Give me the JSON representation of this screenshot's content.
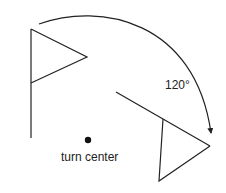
{
  "diagram": {
    "angle_label": "120°",
    "center_label": "turn center",
    "colors": {
      "stroke": "#222222",
      "background": "#ffffff"
    },
    "original_flag": {
      "pole": [
        [
          31,
          29
        ],
        [
          31,
          138
        ]
      ],
      "triangle": [
        [
          31,
          29
        ],
        [
          87,
          57
        ],
        [
          31,
          83
        ]
      ]
    },
    "rotated_flag": {
      "pole": [
        [
          116,
          92
        ],
        [
          210,
          146
        ]
      ],
      "triangle": [
        [
          163,
          119
        ],
        [
          210,
          146
        ],
        [
          159,
          181
        ]
      ]
    },
    "turn_center": [
      88,
      140
    ],
    "rotation_arc": {
      "from": [
        39,
        24
      ],
      "to": [
        211,
        133
      ],
      "direction": "clockwise"
    }
  }
}
